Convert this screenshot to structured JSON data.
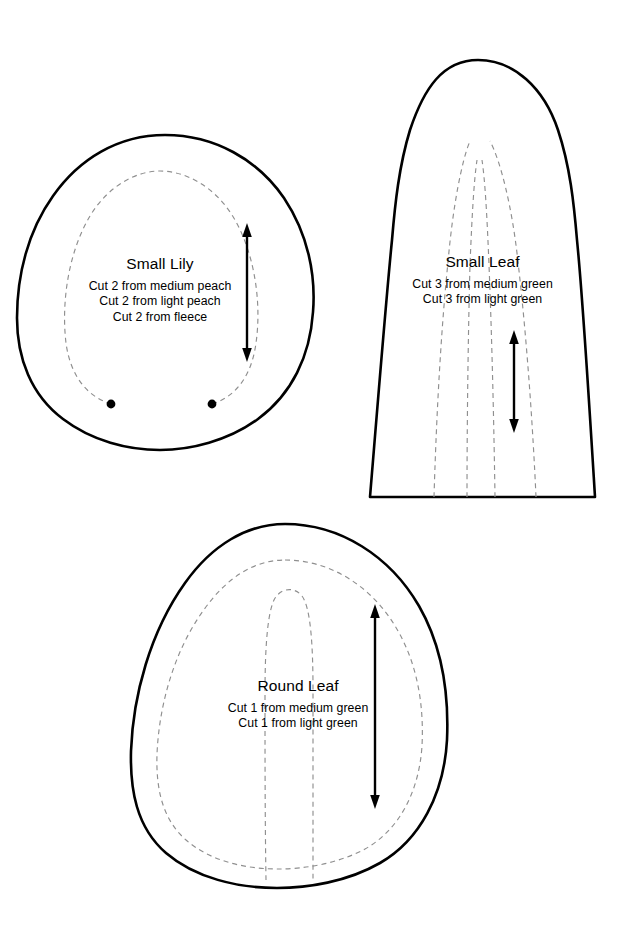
{
  "page": {
    "background_color": "#ffffff",
    "ink_color": "#000000",
    "stitch_line_color": "#8f8f8f",
    "width": 630,
    "height": 933
  },
  "pieces": [
    {
      "id": "small-lily",
      "title": "Small Lily",
      "instructions": [
        "Cut 2 from medium peach",
        "Cut 2 from light peach",
        "Cut 2 from fleece"
      ],
      "markings": {
        "grain_arrow": "double-headed-vertical-arrow",
        "placement_dots": 2,
        "stitch_line": "dashed-inner-seam-line"
      }
    },
    {
      "id": "small-leaf",
      "title": "Small Leaf",
      "instructions": [
        "Cut 3 from medium green",
        "Cut 3 from light green"
      ],
      "markings": {
        "grain_arrow": "double-headed-vertical-arrow",
        "placement_dots": 0,
        "stitch_line": "dashed-vein-lines",
        "vein_count": 4
      }
    },
    {
      "id": "round-leaf",
      "title": "Round Leaf",
      "instructions": [
        "Cut 1 from medium green",
        "Cut 1 from light green"
      ],
      "markings": {
        "grain_arrow": "double-headed-vertical-arrow",
        "placement_dots": 0,
        "stitch_line": "dashed-inner-seam-line",
        "vein_count": 1
      }
    }
  ]
}
